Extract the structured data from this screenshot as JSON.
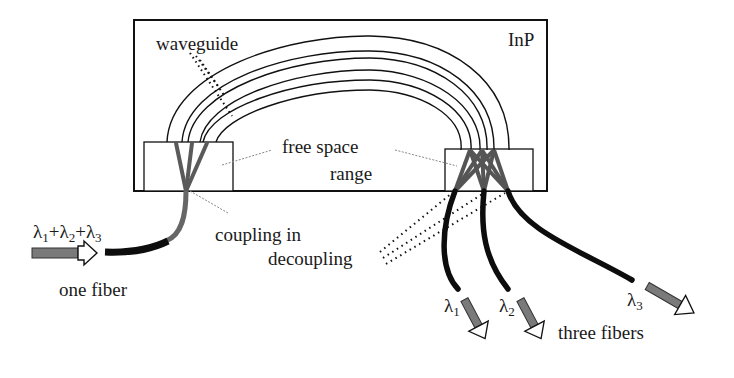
{
  "diagram": {
    "type": "optical demultiplexer (arrayed waveguide grating) schematic",
    "chip": {
      "label": "InP"
    },
    "labels": {
      "waveguide": "waveguide",
      "free_space_line1": "free space",
      "free_space_line2": "range",
      "coupling_in": "coupling in",
      "decoupling": "decoupling",
      "one_fiber": "one fiber",
      "three_fibers": "three fibers"
    },
    "input": {
      "lambda_symbol": "λ",
      "wavelengths": [
        "1",
        "2",
        "3"
      ],
      "plus": "+"
    },
    "outputs": [
      {
        "symbol": "λ",
        "index": "1"
      },
      {
        "symbol": "λ",
        "index": "2"
      },
      {
        "symbol": "λ",
        "index": "3"
      }
    ],
    "colors": {
      "outline": "#111111",
      "fiber": "#0d0d0d",
      "guide_gray": "#5a5a5a",
      "arrow_fill": "#777777",
      "leader": "#888888"
    }
  }
}
